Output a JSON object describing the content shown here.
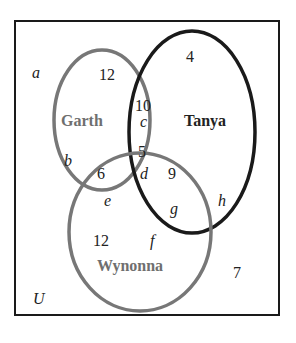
{
  "diagram": {
    "type": "venn",
    "universe_label": "U",
    "sets": [
      {
        "name": "Garth",
        "color": "#777777"
      },
      {
        "name": "Tanya",
        "color": "#1a1a1a"
      },
      {
        "name": "Wynonna",
        "color": "#777777"
      }
    ],
    "region_counts": {
      "garth_only": "12",
      "garth_tanya_only": "10",
      "all_three": "5",
      "garth_wynonna_only": "6",
      "tanya_wynonna_only": "9",
      "tanya_only": "4",
      "wynonna_only": "12",
      "outside": "7"
    },
    "region_labels": {
      "outside": "a",
      "garth_only": "b",
      "garth_tanya_only": "c",
      "all_three": "d",
      "garth_wynonna_only": "e",
      "wynonna_only": "f",
      "tanya_wynonna_only": "g",
      "tanya_only": "h"
    }
  }
}
